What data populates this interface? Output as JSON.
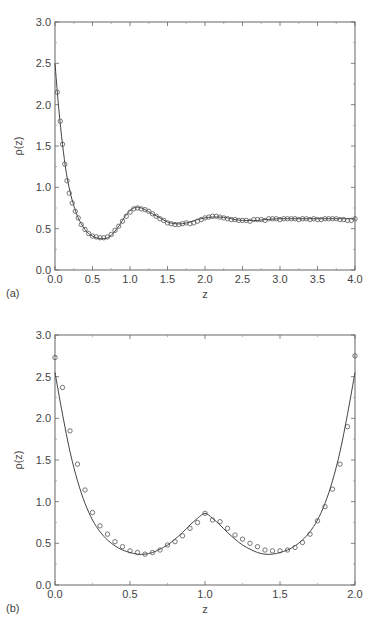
{
  "chart_data": [
    {
      "type": "line",
      "panel_label": "(a)",
      "title": "",
      "xlabel": "z",
      "ylabel": "ρ(z)",
      "xlim": [
        0,
        4.0
      ],
      "ylim": [
        0,
        3.0
      ],
      "xticks": [
        "0.0",
        "0.5",
        "1.0",
        "1.5",
        "2.0",
        "2.5",
        "3.0",
        "3.5",
        "4.0"
      ],
      "yticks": [
        "0.0",
        "0.5",
        "1.0",
        "1.5",
        "2.0",
        "2.5",
        "3.0"
      ],
      "grid": false,
      "legend": null,
      "series": [
        {
          "name": "theory",
          "style": "solid-line",
          "x": [
            0.0,
            0.05,
            0.1,
            0.15,
            0.2,
            0.25,
            0.3,
            0.35,
            0.4,
            0.45,
            0.5,
            0.55,
            0.6,
            0.65,
            0.7,
            0.75,
            0.8,
            0.85,
            0.9,
            0.95,
            1.0,
            1.05,
            1.1,
            1.15,
            1.2,
            1.3,
            1.4,
            1.5,
            1.6,
            1.7,
            1.8,
            1.9,
            2.0,
            2.1,
            2.2,
            2.3,
            2.4,
            2.5,
            2.6,
            2.7,
            2.8,
            3.0,
            3.2,
            3.4,
            3.6,
            3.8,
            4.0
          ],
          "y": [
            2.5,
            1.95,
            1.52,
            1.18,
            0.95,
            0.78,
            0.65,
            0.56,
            0.49,
            0.44,
            0.41,
            0.39,
            0.38,
            0.38,
            0.39,
            0.42,
            0.47,
            0.53,
            0.6,
            0.67,
            0.72,
            0.75,
            0.76,
            0.75,
            0.73,
            0.68,
            0.63,
            0.58,
            0.56,
            0.56,
            0.58,
            0.61,
            0.63,
            0.64,
            0.64,
            0.63,
            0.61,
            0.6,
            0.6,
            0.6,
            0.61,
            0.62,
            0.62,
            0.62,
            0.62,
            0.62,
            0.62
          ]
        },
        {
          "name": "simulation",
          "style": "open-circles",
          "x": [
            0.03,
            0.07,
            0.1,
            0.13,
            0.16,
            0.19,
            0.23,
            0.27,
            0.31,
            0.35,
            0.4,
            0.45,
            0.5,
            0.55,
            0.6,
            0.65,
            0.7,
            0.75,
            0.8,
            0.85,
            0.9,
            0.95,
            1.0,
            1.05,
            1.1,
            1.15,
            1.2,
            1.25,
            1.3,
            1.35,
            1.4,
            1.45,
            1.5,
            1.55,
            1.6,
            1.65,
            1.7,
            1.75,
            1.8,
            1.85,
            1.9,
            1.95,
            2.0,
            2.05,
            2.1,
            2.15,
            2.2,
            2.25,
            2.3,
            2.35,
            2.4,
            2.45,
            2.5,
            2.55,
            2.6,
            2.65,
            2.7,
            2.75,
            2.8,
            2.85,
            2.9,
            2.95,
            3.0,
            3.05,
            3.1,
            3.15,
            3.2,
            3.25,
            3.3,
            3.35,
            3.4,
            3.45,
            3.5,
            3.55,
            3.6,
            3.65,
            3.7,
            3.75,
            3.8,
            3.85,
            3.9,
            3.95,
            4.0
          ],
          "y": [
            2.15,
            1.8,
            1.52,
            1.28,
            1.08,
            0.93,
            0.81,
            0.71,
            0.63,
            0.55,
            0.49,
            0.44,
            0.41,
            0.4,
            0.39,
            0.39,
            0.4,
            0.43,
            0.48,
            0.53,
            0.59,
            0.65,
            0.7,
            0.74,
            0.75,
            0.74,
            0.73,
            0.71,
            0.68,
            0.65,
            0.62,
            0.6,
            0.57,
            0.56,
            0.55,
            0.55,
            0.56,
            0.57,
            0.56,
            0.57,
            0.59,
            0.61,
            0.63,
            0.64,
            0.65,
            0.65,
            0.64,
            0.63,
            0.62,
            0.61,
            0.61,
            0.6,
            0.6,
            0.6,
            0.59,
            0.61,
            0.61,
            0.61,
            0.6,
            0.62,
            0.62,
            0.62,
            0.61,
            0.62,
            0.62,
            0.62,
            0.62,
            0.61,
            0.62,
            0.62,
            0.61,
            0.62,
            0.61,
            0.61,
            0.62,
            0.62,
            0.62,
            0.62,
            0.61,
            0.61,
            0.6,
            0.6,
            0.62
          ]
        }
      ]
    },
    {
      "type": "line",
      "panel_label": "(b)",
      "title": "",
      "xlabel": "z",
      "ylabel": "ρ(z)",
      "xlim": [
        0,
        2.0
      ],
      "ylim": [
        0,
        3.0
      ],
      "xticks": [
        "0.0",
        "0.5",
        "1.0",
        "1.5",
        "2.0"
      ],
      "yticks": [
        "0.0",
        "0.5",
        "1.0",
        "1.5",
        "2.0",
        "2.5",
        "3.0"
      ],
      "grid": false,
      "legend": null,
      "series": [
        {
          "name": "theory",
          "style": "solid-line",
          "x": [
            0.0,
            0.05,
            0.1,
            0.15,
            0.2,
            0.25,
            0.3,
            0.35,
            0.4,
            0.45,
            0.5,
            0.55,
            0.6,
            0.65,
            0.7,
            0.75,
            0.8,
            0.85,
            0.9,
            0.95,
            1.0,
            1.05,
            1.1,
            1.15,
            1.2,
            1.25,
            1.3,
            1.35,
            1.4,
            1.45,
            1.5,
            1.55,
            1.6,
            1.65,
            1.7,
            1.75,
            1.8,
            1.85,
            1.9,
            1.95,
            2.0
          ],
          "y": [
            2.55,
            2.05,
            1.6,
            1.25,
            0.98,
            0.78,
            0.64,
            0.54,
            0.47,
            0.42,
            0.39,
            0.37,
            0.37,
            0.39,
            0.43,
            0.48,
            0.55,
            0.63,
            0.72,
            0.8,
            0.86,
            0.8,
            0.72,
            0.63,
            0.55,
            0.48,
            0.43,
            0.39,
            0.37,
            0.37,
            0.39,
            0.42,
            0.47,
            0.54,
            0.64,
            0.78,
            0.98,
            1.25,
            1.6,
            2.05,
            2.55
          ]
        },
        {
          "name": "simulation",
          "style": "open-circles",
          "x": [
            0.0,
            0.05,
            0.1,
            0.15,
            0.2,
            0.25,
            0.3,
            0.35,
            0.4,
            0.45,
            0.5,
            0.55,
            0.6,
            0.65,
            0.7,
            0.75,
            0.8,
            0.85,
            0.9,
            0.95,
            1.0,
            1.05,
            1.1,
            1.15,
            1.2,
            1.25,
            1.3,
            1.35,
            1.4,
            1.45,
            1.5,
            1.55,
            1.6,
            1.65,
            1.7,
            1.75,
            1.8,
            1.85,
            1.9,
            1.95,
            2.0
          ],
          "y": [
            2.73,
            2.37,
            1.85,
            1.45,
            1.14,
            0.87,
            0.71,
            0.61,
            0.52,
            0.46,
            0.41,
            0.39,
            0.37,
            0.39,
            0.42,
            0.48,
            0.52,
            0.59,
            0.68,
            0.75,
            0.86,
            0.78,
            0.76,
            0.68,
            0.6,
            0.55,
            0.5,
            0.46,
            0.42,
            0.41,
            0.41,
            0.42,
            0.45,
            0.51,
            0.61,
            0.77,
            0.94,
            1.15,
            1.45,
            1.9,
            2.75
          ]
        }
      ]
    }
  ]
}
